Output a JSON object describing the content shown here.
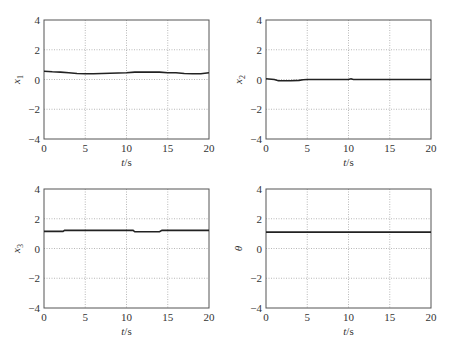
{
  "chart_data": [
    {
      "type": "line",
      "ylabel": "x1",
      "ylabel_main": "x",
      "ylabel_sub": "1",
      "xlabel": "t/s",
      "xlim": [
        0,
        20
      ],
      "ylim": [
        -4,
        4
      ],
      "xticks": [
        "0",
        "5",
        "10",
        "15",
        "20"
      ],
      "yticks": [
        "4",
        "2",
        "0",
        "-2",
        "-4"
      ],
      "grid": true,
      "x": [
        0,
        1,
        2,
        3,
        4,
        5,
        6,
        7,
        8,
        9,
        10,
        11,
        12,
        13,
        14,
        15,
        16,
        17,
        18,
        19,
        20
      ],
      "values": [
        0.55,
        0.52,
        0.5,
        0.45,
        0.4,
        0.38,
        0.38,
        0.4,
        0.42,
        0.44,
        0.46,
        0.5,
        0.5,
        0.5,
        0.5,
        0.45,
        0.45,
        0.4,
        0.38,
        0.38,
        0.45
      ]
    },
    {
      "type": "line",
      "ylabel": "x2",
      "ylabel_main": "x",
      "ylabel_sub": "2",
      "xlabel": "t/s",
      "xlim": [
        0,
        20
      ],
      "ylim": [
        -4,
        4
      ],
      "xticks": [
        "0",
        "5",
        "10",
        "15",
        "20"
      ],
      "yticks": [
        "4",
        "2",
        "0",
        "-2",
        "-4"
      ],
      "grid": true,
      "x": [
        0,
        1,
        1.5,
        2,
        3,
        4,
        4.5,
        5,
        10,
        10.3,
        10.6,
        11,
        15,
        20
      ],
      "values": [
        0.05,
        0.0,
        -0.08,
        -0.08,
        -0.08,
        -0.06,
        -0.02,
        0.0,
        0.0,
        0.05,
        0.0,
        0.0,
        0.0,
        0.0
      ]
    },
    {
      "type": "line",
      "ylabel": "x3",
      "ylabel_main": "x",
      "ylabel_sub": "3",
      "xlabel": "t/s",
      "xlim": [
        0,
        20
      ],
      "ylim": [
        -4,
        4
      ],
      "xticks": [
        "0",
        "5",
        "10",
        "15",
        "20"
      ],
      "yticks": [
        "4",
        "2",
        "0",
        "-2",
        "-4"
      ],
      "grid": true,
      "x": [
        0,
        2.3,
        2.5,
        10.8,
        11,
        14,
        14.3,
        20
      ],
      "values": [
        1.15,
        1.15,
        1.22,
        1.22,
        1.12,
        1.12,
        1.22,
        1.22
      ]
    },
    {
      "type": "line",
      "ylabel": "θ",
      "ylabel_main": "θ",
      "ylabel_sub": "",
      "xlabel": "t/s",
      "xlim": [
        0,
        20
      ],
      "ylim": [
        -4,
        4
      ],
      "xticks": [
        "0",
        "5",
        "10",
        "15",
        "20"
      ],
      "yticks": [
        "4",
        "2",
        "0",
        "-2",
        "-4"
      ],
      "grid": true,
      "x": [
        0,
        20
      ],
      "values": [
        1.1,
        1.1
      ]
    }
  ],
  "labels": {
    "xlabel_main": "t",
    "xlabel_unit": "/s"
  }
}
